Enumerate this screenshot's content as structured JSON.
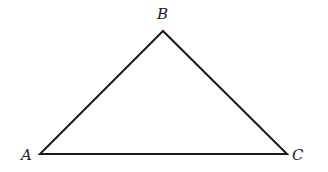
{
  "diagram": {
    "type": "triangle",
    "stroke_color": "#1a1a1a",
    "vertices": [
      {
        "label": "A",
        "x": 40,
        "y": 154
      },
      {
        "label": "B",
        "x": 163,
        "y": 31
      },
      {
        "label": "C",
        "x": 287,
        "y": 154
      }
    ],
    "labels": {
      "a": "A",
      "b": "B",
      "c": "C"
    }
  }
}
